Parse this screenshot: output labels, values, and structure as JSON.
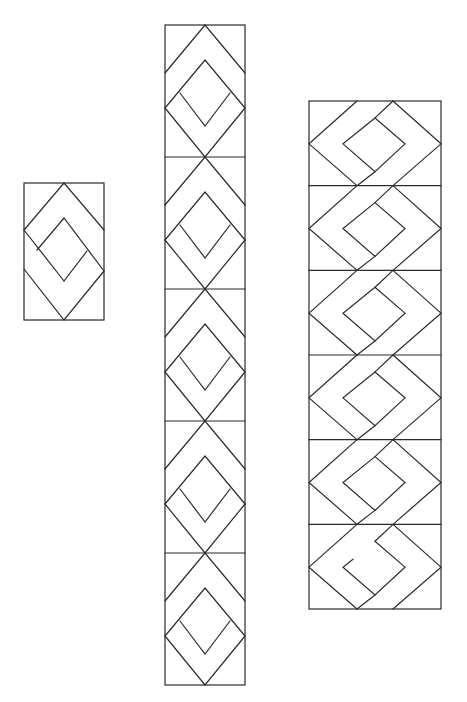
{
  "canvas": {
    "width": 467,
    "height": 702,
    "background": "#ffffff",
    "stroke": "#2b2b2b"
  },
  "figures": [
    {
      "id": "single-block",
      "x": 24,
      "y": 183,
      "width": 80,
      "height": 137,
      "cells": 1,
      "motif": "single-woven-diamond",
      "lines": [
        [
          [
            0,
            47
          ],
          [
            40,
            0
          ],
          [
            80,
            47
          ]
        ],
        [
          [
            0,
            47
          ],
          [
            40,
            98
          ]
        ],
        [
          [
            13,
            67
          ],
          [
            40,
            35
          ],
          [
            80,
            88
          ]
        ],
        [
          [
            63,
            68
          ],
          [
            40,
            98
          ]
        ],
        [
          [
            0,
            86
          ],
          [
            40,
            137
          ],
          [
            80,
            88
          ]
        ]
      ]
    },
    {
      "id": "vertical-strip-middle",
      "x": 165,
      "y": 25,
      "width": 80,
      "height": 660,
      "cells": 5,
      "cell_height": 132,
      "motif": "nested-diamond-chevron",
      "lines": [
        [
          [
            0,
            48
          ],
          [
            40,
            0
          ],
          [
            80,
            48
          ]
        ],
        [
          [
            0,
            83
          ],
          [
            40,
            35
          ],
          [
            80,
            83
          ]
        ],
        [
          [
            15,
            68
          ],
          [
            40,
            101
          ],
          [
            65,
            68
          ]
        ],
        [
          [
            0,
            83
          ],
          [
            40,
            132
          ],
          [
            80,
            83
          ]
        ]
      ]
    },
    {
      "id": "vertical-strip-right",
      "x": 309,
      "y": 101,
      "width": 132,
      "height": 508,
      "cells": 6,
      "cell_height": 84.7,
      "motif": "interlocking-chain",
      "lines": [
        [
          [
            48,
            0
          ],
          [
            0,
            43
          ],
          [
            48,
            85
          ]
        ],
        [
          [
            84,
            0
          ],
          [
            132,
            43
          ],
          [
            84,
            85
          ]
        ],
        [
          [
            84,
            0
          ],
          [
            66,
            17
          ]
        ],
        [
          [
            66,
            17
          ],
          [
            96,
            43
          ],
          [
            66,
            71
          ],
          [
            34,
            43
          ],
          [
            66,
            17
          ]
        ],
        [
          [
            66,
            71
          ],
          [
            48,
            85
          ]
        ]
      ],
      "last_cell_gap": true
    }
  ]
}
